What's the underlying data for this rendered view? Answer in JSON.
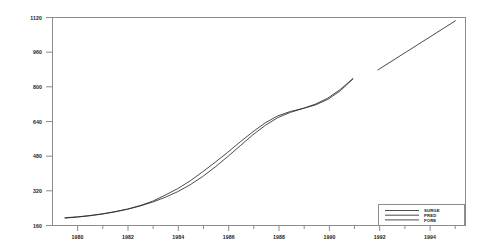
{
  "chart_data": {
    "type": "line",
    "title": "",
    "subtitle": "",
    "xlabel": "",
    "ylabel": "",
    "xlim": [
      1979,
      1995.5
    ],
    "ylim": [
      160,
      1120
    ],
    "grid": false,
    "legend_position": "bottom-right",
    "x_ticks": [
      "1980",
      "1982",
      "1984",
      "1986",
      "1988",
      "1990",
      "1992",
      "1994"
    ],
    "x_tick_values": [
      1980,
      1982,
      1984,
      1986,
      1988,
      1990,
      1992,
      1994
    ],
    "x_minor_tick_values": [
      1981,
      1983,
      1985,
      1987,
      1989,
      1991,
      1993,
      1995
    ],
    "y_ticks": [
      "160",
      "320",
      "480",
      "640",
      "800",
      "960",
      "1120"
    ],
    "y_tick_values": [
      160,
      320,
      480,
      640,
      800,
      960,
      1120
    ],
    "series": [
      {
        "name": "SURGE",
        "style": "solid",
        "color": "#2b2b2b",
        "x": [
          1979.5,
          1980.0,
          1980.5,
          1981.0,
          1981.5,
          1982.0,
          1982.5,
          1983.0,
          1983.5,
          1984.0,
          1984.5,
          1985.0,
          1985.5,
          1986.0,
          1986.5,
          1987.0,
          1987.5,
          1988.0,
          1988.5,
          1989.0,
          1989.5,
          1990.0,
          1990.5,
          1991.0
        ],
        "values": [
          196,
          200,
          206,
          214,
          224,
          236,
          252,
          272,
          300,
          330,
          366,
          408,
          452,
          498,
          546,
          592,
          634,
          666,
          686,
          700,
          720,
          748,
          788,
          838
        ]
      },
      {
        "name": "PRED",
        "style": "solid",
        "color": "#2b2b2b",
        "x": [
          1979.5,
          1980.0,
          1980.5,
          1981.0,
          1981.5,
          1982.0,
          1982.5,
          1983.0,
          1983.5,
          1984.0,
          1984.5,
          1985.0,
          1985.5,
          1986.0,
          1986.5,
          1987.0,
          1987.5,
          1988.0,
          1988.5,
          1989.0,
          1989.5,
          1990.0,
          1990.5,
          1991.0
        ],
        "values": [
          194,
          199,
          205,
          213,
          223,
          235,
          250,
          268,
          290,
          316,
          348,
          386,
          430,
          478,
          528,
          578,
          622,
          658,
          682,
          700,
          716,
          742,
          782,
          836
        ]
      },
      {
        "name": "FORE",
        "style": "solid",
        "color": "#2b2b2b",
        "x": [
          1992.0,
          1995.1
        ],
        "values": [
          878,
          1105
        ]
      }
    ]
  },
  "legend": {
    "entries": [
      {
        "label": "SURGE"
      },
      {
        "label": "PRED"
      },
      {
        "label": "FORE"
      }
    ]
  }
}
